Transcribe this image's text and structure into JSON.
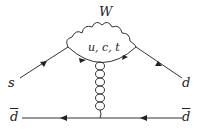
{
  "diagram": {
    "type": "feynman",
    "labels": {
      "boson": "W",
      "loop_quarks": "u, c, t",
      "incoming_quark": "s",
      "outgoing_quark": "d",
      "antiquark_left": "d",
      "antiquark_right": "d"
    },
    "colors": {
      "line": "#333333",
      "text": "#222222"
    }
  }
}
